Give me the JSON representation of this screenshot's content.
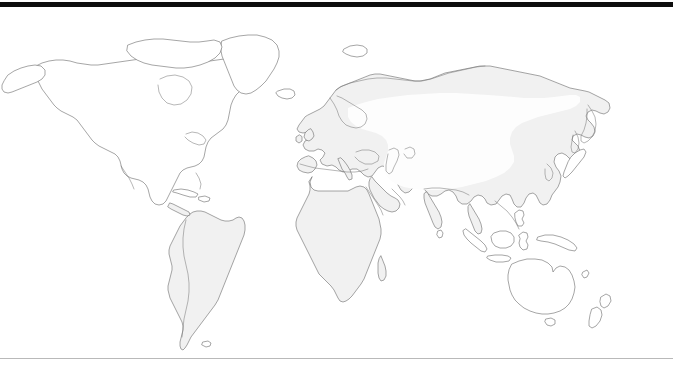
{
  "figure": {
    "kind": "world-distribution-map",
    "caption": "",
    "projection": "equirectangular",
    "background_color": "#ffffff",
    "rules": {
      "top_rule_color": "#0d0d0d",
      "top_rule_thickness_px": 5,
      "bottom_rule_color": "#b9b9b9",
      "bottom_rule_thickness_px": 1
    },
    "legend_present": false,
    "labels_present": false,
    "axis_present": false
  },
  "map": {
    "title": "",
    "coastline_color": "#6f6f6f",
    "land_fill_shaded": "#f1f1f1",
    "land_fill_plain": "#ffffff",
    "range_overlay_color": "#fdfdfd",
    "regions": [
      {
        "id": "north-america",
        "name": "North America",
        "fill": "plain",
        "in_range": false
      },
      {
        "id": "greenland",
        "name": "Greenland",
        "fill": "plain",
        "in_range": false
      },
      {
        "id": "south-america",
        "name": "South America",
        "fill": "shaded",
        "in_range": false
      },
      {
        "id": "africa",
        "name": "Africa",
        "fill": "shaded",
        "in_range": false
      },
      {
        "id": "europe",
        "name": "Europe",
        "fill": "shaded",
        "in_range": false
      },
      {
        "id": "asia",
        "name": "Asia",
        "fill": "shaded",
        "in_range": true
      },
      {
        "id": "southeast-asia-islands",
        "name": "Southeast Asian Islands",
        "fill": "plain",
        "in_range": false
      },
      {
        "id": "australia",
        "name": "Australia",
        "fill": "plain",
        "in_range": false
      },
      {
        "id": "new-zealand",
        "name": "New Zealand",
        "fill": "plain",
        "in_range": false
      },
      {
        "id": "japan",
        "name": "Japan",
        "fill": "plain",
        "in_range": false
      },
      {
        "id": "madagascar",
        "name": "Madagascar",
        "fill": "shaded",
        "in_range": false
      },
      {
        "id": "iceland",
        "name": "Iceland",
        "fill": "plain",
        "in_range": false
      },
      {
        "id": "british-isles",
        "name": "British Isles",
        "fill": "shaded",
        "in_range": false
      }
    ],
    "range_band": {
      "name": "Distribution range",
      "extent_description": "Broad band across central and northern Eurasia, from eastern Europe to northeast Asia",
      "color": "#fdfdfd"
    }
  }
}
